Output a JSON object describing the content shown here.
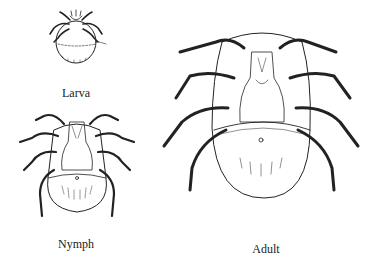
{
  "figure": {
    "stages": [
      {
        "id": "larva",
        "label": "Larva",
        "legs": 6
      },
      {
        "id": "nymph",
        "label": "Nymph",
        "legs": 8
      },
      {
        "id": "adult",
        "label": "Adult",
        "legs": 8
      }
    ],
    "colors": {
      "line": "#222222",
      "background": "#ffffff"
    }
  }
}
